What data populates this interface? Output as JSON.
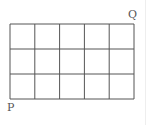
{
  "diagram": {
    "type": "grid",
    "columns": 5,
    "rows": 3,
    "line_color": "#555555",
    "grid_box": {
      "left": 10,
      "top": 24,
      "right": 134,
      "bottom": 99
    },
    "labels": [
      {
        "text": "Q",
        "position": "top-right-corner",
        "x": 128,
        "y": 9
      },
      {
        "text": "P",
        "position": "bottom-left-corner",
        "x": 7,
        "y": 102
      }
    ]
  }
}
